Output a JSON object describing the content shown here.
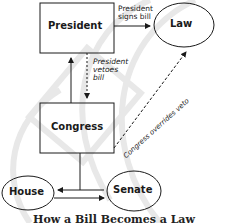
{
  "diagram": {
    "title": "How a Bill Becomes a Law",
    "nodes": {
      "president": "President",
      "law": "Law",
      "congress": "Congress",
      "house": "House",
      "senate": "Senate"
    },
    "edges": {
      "president_signs": "President signs bill",
      "president_signs_line1": "President",
      "president_signs_line2": "signs bill",
      "president_vetoes_line1": "President",
      "president_vetoes_line2": "vetoes",
      "president_vetoes_line3": "bill",
      "congress_overrides": "Congress overrides veto"
    },
    "colors": {
      "stroke": "#1a1a1a",
      "watermark": "#e6e6e6"
    }
  }
}
